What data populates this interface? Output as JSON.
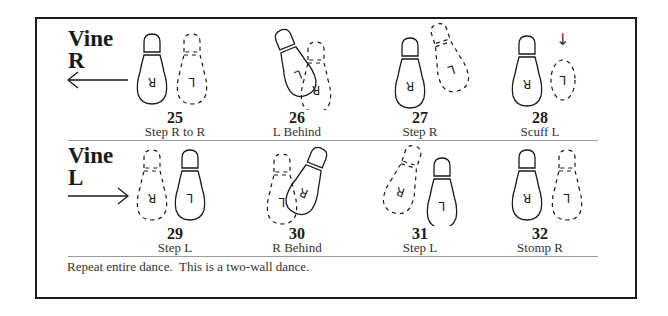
{
  "sections": [
    {
      "title_line1": "Vine",
      "title_line2": "R",
      "direction": "left",
      "steps": [
        {
          "number": "25",
          "label": "Step R to R"
        },
        {
          "number": "26",
          "label": "L Behind"
        },
        {
          "number": "27",
          "label": "Step R"
        },
        {
          "number": "28",
          "label": "Scuff L"
        }
      ]
    },
    {
      "title_line1": "Vine",
      "title_line2": "L",
      "direction": "right",
      "steps": [
        {
          "number": "29",
          "label": "Step L"
        },
        {
          "number": "30",
          "label": "R Behind"
        },
        {
          "number": "31",
          "label": "Step L"
        },
        {
          "number": "32",
          "label": "Stomp R"
        }
      ]
    }
  ],
  "footer_note": "Repeat entire dance.  This is a two-wall dance.",
  "footprint_letters": {
    "right": "R",
    "left": "L"
  },
  "icons": {
    "scuff_arrow": "↓"
  }
}
